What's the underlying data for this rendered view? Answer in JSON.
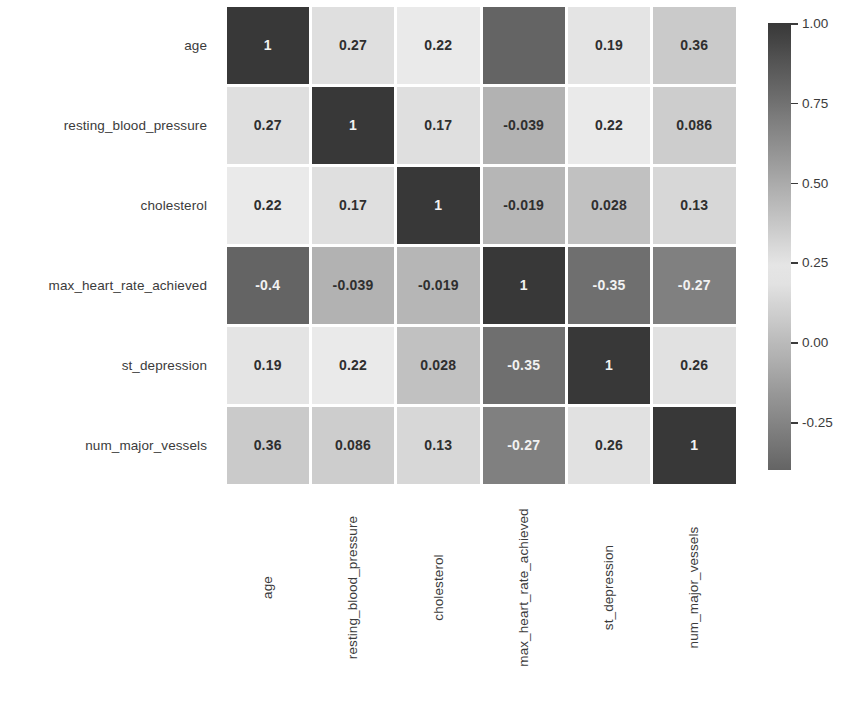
{
  "chart_data": {
    "type": "heatmap",
    "title": "",
    "xlabel": "",
    "ylabel": "",
    "grid": false,
    "legend_position": "right",
    "colormap": "diverging-grayscale",
    "categories": [
      "age",
      "resting_blood_pressure",
      "cholesterol",
      "max_heart_rate_achieved",
      "st_depression",
      "num_major_vessels"
    ],
    "x_tick_labels": [
      "age",
      "resting_blood_pressure",
      "cholesterol",
      "max_heart_rate_achieved",
      "st_depression",
      "num_major_vessels"
    ],
    "y_tick_labels": [
      "age",
      "resting_blood_pressure",
      "cholesterol",
      "max_heart_rate_achieved",
      "st_depression",
      "num_major_vessels"
    ],
    "values": [
      [
        1,
        0.27,
        0.22,
        -0.4,
        0.19,
        0.36
      ],
      [
        0.27,
        1,
        0.17,
        -0.039,
        0.22,
        0.086
      ],
      [
        0.22,
        0.17,
        1,
        -0.019,
        0.028,
        0.13
      ],
      [
        -0.4,
        -0.039,
        -0.019,
        1,
        -0.35,
        -0.27
      ],
      [
        0.19,
        0.22,
        0.028,
        -0.35,
        1,
        0.26
      ],
      [
        0.36,
        0.086,
        0.13,
        -0.27,
        0.26,
        1
      ]
    ],
    "cell_labels": [
      [
        "1",
        "0.27",
        "0.22",
        "-0.4",
        "0.19",
        "0.36"
      ],
      [
        "0.27",
        "1",
        "0.17",
        "-0.039",
        "0.22",
        "0.086"
      ],
      [
        "0.22",
        "0.17",
        "1",
        "-0.019",
        "0.028",
        "0.13"
      ],
      [
        "-0.4",
        "-0.039",
        "-0.019",
        "1",
        "-0.35",
        "-0.27"
      ],
      [
        "0.19",
        "0.22",
        "0.028",
        "-0.35",
        "1",
        "0.26"
      ],
      [
        "0.36",
        "0.086",
        "0.13",
        "-0.27",
        "0.26",
        "1"
      ]
    ],
    "cell_label_hidden": [
      [
        false,
        false,
        false,
        true,
        false,
        false
      ],
      [
        false,
        false,
        false,
        false,
        false,
        false
      ],
      [
        false,
        false,
        false,
        false,
        false,
        false
      ],
      [
        false,
        false,
        false,
        false,
        false,
        false
      ],
      [
        false,
        false,
        false,
        false,
        false,
        false
      ],
      [
        false,
        false,
        false,
        false,
        false,
        false
      ]
    ],
    "zlim": [
      -0.4,
      1.0
    ],
    "colorbar": {
      "ticks": [
        1.0,
        0.75,
        0.5,
        0.25,
        0.0,
        -0.25
      ],
      "tick_labels": [
        "1.00",
        "0.75",
        "0.50",
        "0.25",
        "0.00",
        "-0.25"
      ],
      "vmin": -0.4,
      "vmax": 1.0,
      "colors": {
        "high": "#3a3a3a",
        "mid_light": "#eaeaea",
        "low": "#6a6a6a"
      }
    },
    "text_colors": {
      "on_light": "#2f2f2f",
      "on_dark": "#f2f2f2"
    }
  }
}
